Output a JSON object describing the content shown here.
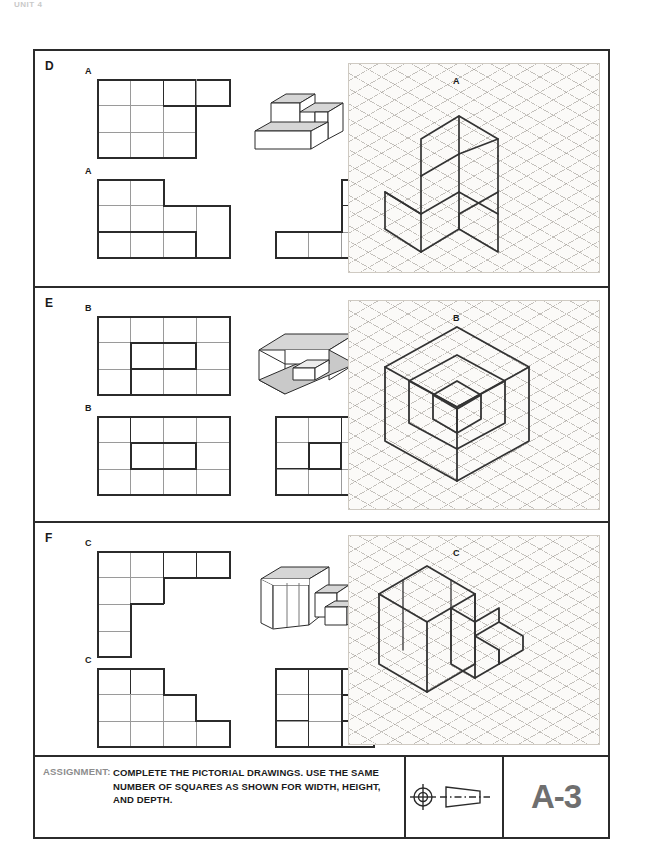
{
  "header": {
    "faint_text": "UNIT 4"
  },
  "sheet": {
    "number": "A-3",
    "assignment_label": "ASSIGNMENT:",
    "assignment_text": "COMPLETE THE PICTORIAL DRAWINGS. USE THE SAME\nNUMBER OF SQUARES AS SHOWN FOR WIDTH, HEIGHT,\nAND DEPTH.",
    "projection_symbol": "third-angle-projection-symbol"
  },
  "panels": [
    {
      "letter": "D",
      "part_label": "A",
      "views": [
        {
          "name": "top-view",
          "label": "A",
          "cols": 4,
          "rows": 3
        },
        {
          "name": "front-view",
          "label": "A",
          "cols": 4,
          "rows": 3
        },
        {
          "name": "side-view",
          "label": "A",
          "cols": 3,
          "rows": 3
        }
      ],
      "pictorial": "stepped-block-pictorial",
      "isometric": "isometric-stepped-block"
    },
    {
      "letter": "E",
      "part_label": "B",
      "views": [
        {
          "name": "top-view",
          "label": "B",
          "cols": 4,
          "rows": 3
        },
        {
          "name": "front-view",
          "label": "B",
          "cols": 4,
          "rows": 3
        },
        {
          "name": "side-view",
          "label": "B",
          "cols": 3,
          "rows": 3
        }
      ],
      "pictorial": "open-box-with-inner-block-pictorial",
      "isometric": "isometric-open-box-with-inner-block"
    },
    {
      "letter": "F",
      "part_label": "C",
      "views": [
        {
          "name": "top-view",
          "label": "C",
          "cols": 4,
          "rows": 3
        },
        {
          "name": "front-view",
          "label": "C",
          "cols": 4,
          "rows": 3
        },
        {
          "name": "side-view",
          "label": "C",
          "cols": 3,
          "rows": 3
        }
      ],
      "pictorial": "staircase-block-pictorial",
      "isometric": "isometric-staircase-block"
    }
  ],
  "colors": {
    "line": "#2b2b2b",
    "grid_light": "#9a9a9a",
    "iso_grid": "#96918a",
    "iso_bg": "#fbfaf8",
    "number": "#6f6f6f",
    "label_gray": "#8d8d8d"
  }
}
